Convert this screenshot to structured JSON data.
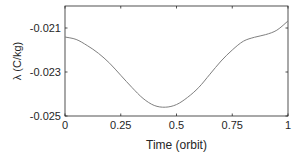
{
  "chart_data": {
    "type": "line",
    "title": "",
    "xlabel": "Time (orbit)",
    "ylabel": "λ (C/kg)",
    "xlim": [
      0,
      1
    ],
    "ylim": [
      -0.025,
      -0.02
    ],
    "xticks": [
      0,
      0.25,
      0.5,
      0.75,
      1
    ],
    "xtick_labels": [
      "0",
      "0.25",
      "0.5",
      "0.75",
      "1"
    ],
    "yticks": [
      -0.025,
      -0.023,
      -0.021
    ],
    "ytick_labels": [
      "-0.025",
      "-0.023",
      "-0.021"
    ],
    "grid": false,
    "legend": null,
    "series": [
      {
        "name": "lambda",
        "color": "#7f7f7f",
        "x": [
          0,
          0.05,
          0.1,
          0.15,
          0.2,
          0.25,
          0.3,
          0.35,
          0.4,
          0.45,
          0.5,
          0.55,
          0.6,
          0.65,
          0.7,
          0.75,
          0.8,
          0.85,
          0.9,
          0.95,
          1.0
        ],
        "y": [
          -0.02141,
          -0.02152,
          -0.0218,
          -0.02215,
          -0.0226,
          -0.02315,
          -0.0237,
          -0.0242,
          -0.02452,
          -0.0246,
          -0.02448,
          -0.02415,
          -0.0237,
          -0.0231,
          -0.0225,
          -0.022,
          -0.0216,
          -0.02142,
          -0.0213,
          -0.0211,
          -0.02068
        ]
      }
    ]
  }
}
